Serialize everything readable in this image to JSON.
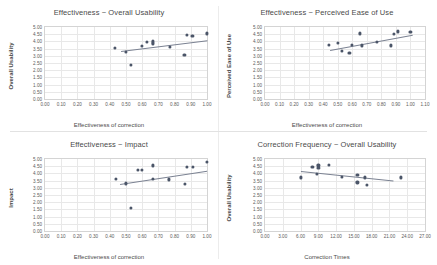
{
  "page": {
    "background": "#ffffff",
    "point_color": "#4b5568",
    "trend_color": "#7b8292",
    "grid_color": "#e8e8e8",
    "axis_color": "#d4d4d4"
  },
  "chart_data": [
    {
      "id": "effectiveness-overall-usability",
      "type": "scatter",
      "title": "Effectiveness ~ Overall Usability",
      "xlabel": "Effectiveness of correction",
      "ylabel": "Overall Usability",
      "xlim": [
        0.0,
        1.0
      ],
      "ylim": [
        0.0,
        5.0
      ],
      "xticks": [
        "0.00",
        "0.10",
        "0.20",
        "0.30",
        "0.40",
        "0.50",
        "0.60",
        "0.70",
        "0.80",
        "0.90",
        "1.00"
      ],
      "yticks": [
        "0.00",
        "0.50",
        "1.00",
        "1.50",
        "2.00",
        "2.50",
        "3.00",
        "3.50",
        "4.00",
        "4.50",
        "5.00"
      ],
      "grid": true,
      "legend": "none",
      "points": [
        {
          "x": 0.43,
          "y": 3.55
        },
        {
          "x": 0.5,
          "y": 3.25
        },
        {
          "x": 0.53,
          "y": 2.35
        },
        {
          "x": 0.6,
          "y": 3.7
        },
        {
          "x": 0.63,
          "y": 3.95
        },
        {
          "x": 0.665,
          "y": 4.0
        },
        {
          "x": 0.665,
          "y": 3.85
        },
        {
          "x": 0.665,
          "y": 3.9
        },
        {
          "x": 0.77,
          "y": 3.6
        },
        {
          "x": 0.86,
          "y": 3.05
        },
        {
          "x": 0.875,
          "y": 4.45
        },
        {
          "x": 0.91,
          "y": 4.4
        },
        {
          "x": 1.0,
          "y": 4.55
        }
      ],
      "trend": {
        "x1": 0.47,
        "y1": 3.35,
        "x2": 1.0,
        "y2": 4.1
      }
    },
    {
      "id": "effectiveness-perceived-ease-of-use",
      "type": "scatter",
      "title": "Effectiveness ~ Perceived Ease of Use",
      "xlabel": "Effectiveness of correction",
      "ylabel": "Perceived Ease of Use",
      "xlim": [
        0.0,
        1.1
      ],
      "ylim": [
        0.0,
        5.0
      ],
      "xticks": [
        "0.00",
        "0.10",
        "0.20",
        "0.30",
        "0.40",
        "0.50",
        "0.60",
        "0.70",
        "0.80",
        "0.90",
        "1.00",
        "1.10"
      ],
      "yticks": [
        "0.00",
        "0.50",
        "1.00",
        "1.50",
        "2.00",
        "2.50",
        "3.00",
        "3.50",
        "4.00",
        "4.50",
        "5.00"
      ],
      "grid": true,
      "legend": "none",
      "points": [
        {
          "x": 0.44,
          "y": 3.75
        },
        {
          "x": 0.5,
          "y": 3.9
        },
        {
          "x": 0.53,
          "y": 3.35
        },
        {
          "x": 0.58,
          "y": 3.18
        },
        {
          "x": 0.6,
          "y": 3.75
        },
        {
          "x": 0.655,
          "y": 4.55
        },
        {
          "x": 0.665,
          "y": 3.72
        },
        {
          "x": 0.77,
          "y": 3.95
        },
        {
          "x": 0.865,
          "y": 3.72
        },
        {
          "x": 0.885,
          "y": 4.5
        },
        {
          "x": 0.915,
          "y": 4.7
        },
        {
          "x": 1.0,
          "y": 4.65
        }
      ],
      "trend": {
        "x1": 0.45,
        "y1": 3.42,
        "x2": 1.02,
        "y2": 4.48
      }
    },
    {
      "id": "effectiveness-impact",
      "type": "scatter",
      "title": "Effectiveness ~ Impact",
      "xlabel": "Effectiveness of correction",
      "ylabel": "Impact",
      "xlim": [
        0.0,
        1.0
      ],
      "ylim": [
        0.0,
        5.0
      ],
      "xticks": [
        "0.00",
        "0.10",
        "0.20",
        "0.30",
        "0.40",
        "0.50",
        "0.60",
        "0.70",
        "0.80",
        "0.90",
        "1.00"
      ],
      "yticks": [
        "0.00",
        "0.50",
        "1.00",
        "1.50",
        "2.00",
        "2.50",
        "3.00",
        "3.50",
        "4.00",
        "4.50",
        "5.00"
      ],
      "grid": true,
      "legend": "none",
      "points": [
        {
          "x": 0.44,
          "y": 3.6
        },
        {
          "x": 0.5,
          "y": 3.3
        },
        {
          "x": 0.53,
          "y": 1.6
        },
        {
          "x": 0.575,
          "y": 4.25
        },
        {
          "x": 0.6,
          "y": 4.25
        },
        {
          "x": 0.665,
          "y": 4.55
        },
        {
          "x": 0.665,
          "y": 3.6
        },
        {
          "x": 0.765,
          "y": 3.58
        },
        {
          "x": 0.865,
          "y": 3.25
        },
        {
          "x": 0.875,
          "y": 4.45
        },
        {
          "x": 0.915,
          "y": 4.45
        },
        {
          "x": 1.0,
          "y": 4.8
        }
      ],
      "trend": {
        "x1": 0.46,
        "y1": 3.28,
        "x2": 1.0,
        "y2": 4.2
      }
    },
    {
      "id": "correction-frequency-overall-usability",
      "type": "scatter",
      "title": "Correction Frequency ~ Overall Usability",
      "xlabel": "Correction Times",
      "ylabel": "Overall Usability",
      "xlim": [
        0.0,
        27.0
      ],
      "ylim": [
        0.0,
        5.0
      ],
      "xticks": [
        "0.00",
        "3.00",
        "6.00",
        "9.00",
        "12.00",
        "15.00",
        "18.00",
        "21.00",
        "24.00",
        "27.00"
      ],
      "yticks": [
        "0.00",
        "0.50",
        "1.00",
        "1.50",
        "2.00",
        "2.50",
        "3.00",
        "3.50",
        "4.00",
        "4.50",
        "5.00"
      ],
      "grid": true,
      "legend": "none",
      "points": [
        {
          "x": 6.0,
          "y": 3.72
        },
        {
          "x": 8.0,
          "y": 4.45
        },
        {
          "x": 8.7,
          "y": 3.98
        },
        {
          "x": 9.0,
          "y": 4.55
        },
        {
          "x": 9.0,
          "y": 4.4
        },
        {
          "x": 10.8,
          "y": 4.6
        },
        {
          "x": 13.0,
          "y": 3.75
        },
        {
          "x": 15.6,
          "y": 3.9
        },
        {
          "x": 15.6,
          "y": 3.38
        },
        {
          "x": 16.8,
          "y": 3.72
        },
        {
          "x": 17.2,
          "y": 3.18
        },
        {
          "x": 23.0,
          "y": 3.72
        }
      ],
      "trend": {
        "x1": 6.0,
        "y1": 4.18,
        "x2": 21.6,
        "y2": 3.52
      }
    }
  ]
}
